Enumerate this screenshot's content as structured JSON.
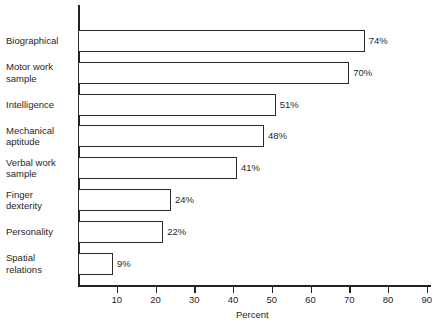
{
  "chart_data": {
    "type": "bar",
    "orientation": "horizontal",
    "title": "",
    "xlabel": "Percent",
    "ylabel": "",
    "categories": [
      "Biographical",
      "Motor work\nsample",
      "Intelligence",
      "Mechanical\naptitude",
      "Verbal work\nsample",
      "Finger\ndexterity",
      "Personality",
      "Spatial\nrelations"
    ],
    "values": [
      74,
      70,
      51,
      48,
      41,
      24,
      22,
      9
    ],
    "value_labels": [
      "74%",
      "70%",
      "51%",
      "48%",
      "41%",
      "24%",
      "22%",
      "9%"
    ],
    "xlim": [
      0,
      90
    ],
    "xticks": [
      10,
      20,
      30,
      40,
      50,
      60,
      70,
      80,
      90
    ],
    "xtick_labels": [
      "10",
      "20",
      "30",
      "40",
      "50",
      "60",
      "70",
      "80",
      "90"
    ],
    "grid": false,
    "legend": null,
    "bar_fill_color": "#ffffff",
    "bar_edge_color": "#2a2a2a",
    "axis_color": "#222222",
    "text_color": "#1f1f1f",
    "background_color": "#ffffff"
  }
}
